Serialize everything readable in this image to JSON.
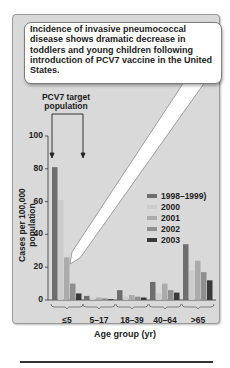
{
  "callout": {
    "text": "Incidence of invasive pneumococcal disease shows dramatic decrease in toddlers and young children following introduction of PCV7 vaccine in the United States."
  },
  "annotation": {
    "target_label": "PCV7 target population"
  },
  "colors": {
    "frame_bg": "#d9d9d9",
    "series": [
      "#6e6e6e",
      "#cccccc",
      "#ababab",
      "#8f8f8f",
      "#3a3a3a"
    ]
  },
  "chart_data": {
    "type": "bar",
    "title": "Incidence of invasive pneumococcal disease shows dramatic decrease in toddlers and young children following introduction of PCV7 vaccine in the United States.",
    "xlabel": "Age group (yr)",
    "ylabel": "Cases per 100,000 population",
    "ylim": [
      0,
      100
    ],
    "yticks": [
      0,
      20,
      40,
      60,
      80,
      100
    ],
    "grid": false,
    "legend_position": "right-center",
    "categories": [
      "≤5",
      "5–17",
      "18–39",
      "40–64",
      ">65"
    ],
    "series": [
      {
        "name": "1998–1999)",
        "values": [
          81,
          2.5,
          6,
          11,
          34
        ]
      },
      {
        "name": "2000",
        "values": [
          61,
          1,
          2,
          4,
          18
        ]
      },
      {
        "name": "2001",
        "values": [
          26,
          1.5,
          3,
          10,
          24
        ]
      },
      {
        "name": "2002",
        "values": [
          10,
          1,
          2,
          6,
          17
        ]
      },
      {
        "name": "2003",
        "values": [
          4,
          0.5,
          1.5,
          4.5,
          12
        ]
      }
    ],
    "annotations": [
      "PCV7 target population (≤5 and 5–17 bracket)"
    ]
  }
}
